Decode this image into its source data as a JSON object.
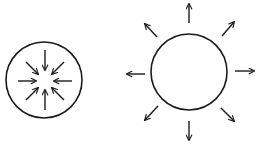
{
  "diagram": {
    "stroke_color": "#1a1a1a",
    "background": "#ffffff",
    "left": {
      "label": "inward arrows",
      "center": [
        44,
        80
      ],
      "radius": 38,
      "arrow_count": 8,
      "direction": "inward"
    },
    "right": {
      "label": "outward arrows",
      "center": [
        189,
        72
      ],
      "radius": 38,
      "arrow_count": 8,
      "direction": "outward"
    }
  }
}
